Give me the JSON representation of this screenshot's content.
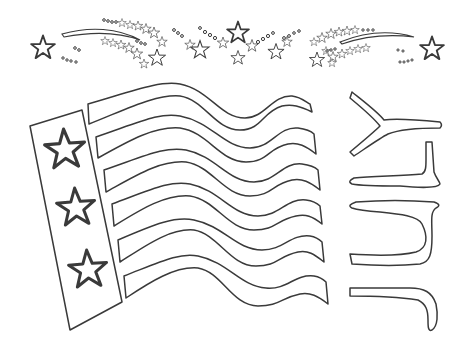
{
  "page": {
    "line_color": "#3a3a3a",
    "background": "#ffffff"
  },
  "flag": {
    "canton_stars": 3,
    "stripes": 6
  },
  "letters": {
    "word": "JULY",
    "orientation": "rotated 90 degrees, reading bottom to top"
  },
  "fireworks": {
    "large_stars": 3,
    "shooting_stars": 2
  }
}
